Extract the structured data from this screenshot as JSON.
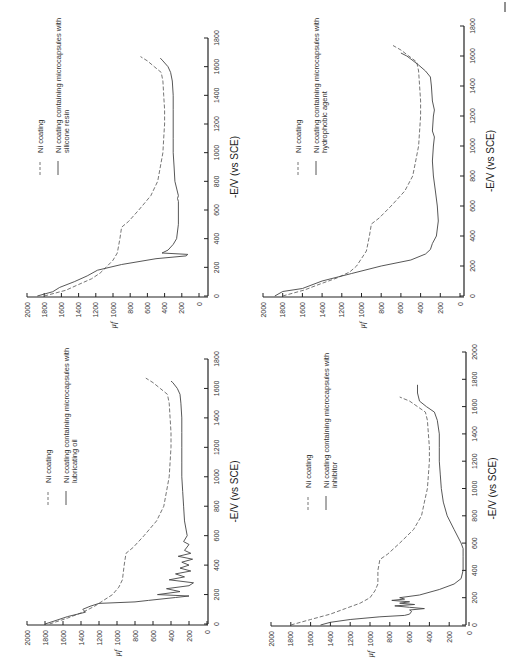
{
  "figure": {
    "orientation": "rotated 90 degrees counter-clockwise",
    "panel_count": 4,
    "corner_mark": "|"
  },
  "chart_data": [
    {
      "type": "line",
      "panel": "top-left",
      "xlabel": "-E/V (vs SCE)",
      "ylabel": "μf",
      "xlim": [
        0,
        1800
      ],
      "ylim": [
        0,
        2000
      ],
      "xticks": [
        "0",
        "200",
        "400",
        "600",
        "800",
        "1000",
        "1200",
        "1400",
        "1600",
        "1800"
      ],
      "yticks": [
        "2000",
        "1800",
        "1600",
        "1400",
        "1200",
        "1000",
        "800",
        "600",
        "400",
        "200",
        "0"
      ],
      "grid": false,
      "legend": [
        "Ni coating",
        "Ni coating containing microcapsules with silicone resin"
      ],
      "series": [
        {
          "name": "Ni coating",
          "style": "dashed",
          "x": [
            0,
            40,
            80,
            120,
            160,
            200,
            250,
            300,
            400,
            480,
            520,
            600,
            700,
            800,
            900,
            1000,
            1100,
            1200,
            1300,
            1400,
            1500,
            1560,
            1600,
            1640,
            1670
          ],
          "y": [
            1800,
            1550,
            1400,
            1250,
            1150,
            1080,
            1000,
            950,
            920,
            900,
            820,
            700,
            560,
            480,
            450,
            420,
            410,
            400,
            400,
            410,
            420,
            440,
            520,
            600,
            680
          ]
        },
        {
          "name": "Ni coating containing microcapsules with silicone resin",
          "style": "solid",
          "x": [
            0,
            30,
            60,
            100,
            140,
            180,
            220,
            260,
            280,
            290,
            300,
            320,
            360,
            400,
            500,
            600,
            660,
            680,
            700,
            800,
            900,
            1000,
            1100,
            1200,
            1300,
            1400,
            1500,
            1560,
            1600,
            1640,
            1660
          ],
          "y": [
            1880,
            1700,
            1620,
            1450,
            1300,
            1180,
            900,
            500,
            150,
            130,
            430,
            360,
            300,
            260,
            240,
            240,
            240,
            250,
            240,
            280,
            290,
            300,
            300,
            300,
            300,
            300,
            310,
            330,
            360,
            420,
            450
          ]
        }
      ]
    },
    {
      "type": "line",
      "panel": "top-right",
      "xlabel": "-E/V (vs SCE)",
      "ylabel": "μf",
      "xlim": [
        0,
        1800
      ],
      "ylim": [
        0,
        2000
      ],
      "xticks": [
        "0",
        "200",
        "400",
        "600",
        "800",
        "1000",
        "1200",
        "1400",
        "1600",
        "1800"
      ],
      "yticks": [
        "2000",
        "1800",
        "1600",
        "1400",
        "1200",
        "1000",
        "800",
        "600",
        "400",
        "200",
        "0"
      ],
      "grid": false,
      "legend": [
        "Ni coating",
        "Ni coating containing microcapsules with hydrophobic agent"
      ],
      "series": [
        {
          "name": "Ni coating",
          "style": "dashed",
          "x": [
            0,
            40,
            80,
            120,
            160,
            200,
            250,
            300,
            400,
            480,
            520,
            600,
            700,
            800,
            900,
            1000,
            1100,
            1200,
            1300,
            1400,
            1500,
            1560,
            1600,
            1640,
            1670
          ],
          "y": [
            1800,
            1580,
            1420,
            1250,
            1120,
            1050,
            1000,
            950,
            920,
            900,
            820,
            700,
            560,
            480,
            450,
            420,
            410,
            400,
            400,
            410,
            420,
            440,
            520,
            600,
            680
          ]
        },
        {
          "name": "Ni coating containing microcapsules with hydrophobic agent",
          "style": "solid",
          "x": [
            0,
            30,
            50,
            100,
            150,
            200,
            240,
            280,
            310,
            350,
            400,
            500,
            600,
            700,
            800,
            900,
            1000,
            1060,
            1100,
            1200,
            1240,
            1300,
            1400,
            1460,
            1500,
            1540,
            1580,
            1600,
            1620
          ],
          "y": [
            1880,
            1800,
            1600,
            1400,
            1100,
            800,
            500,
            350,
            300,
            280,
            240,
            220,
            230,
            250,
            270,
            280,
            270,
            260,
            280,
            270,
            260,
            280,
            290,
            300,
            350,
            420,
            500,
            540,
            600
          ]
        }
      ]
    },
    {
      "type": "line",
      "panel": "bottom-left",
      "xlabel": "-E/V (vs SCE)",
      "ylabel": "μf",
      "xlim": [
        0,
        1800
      ],
      "ylim": [
        0,
        2000
      ],
      "xticks": [
        "0",
        "200",
        "400",
        "600",
        "800",
        "1000",
        "1200",
        "1400",
        "1600",
        "1800"
      ],
      "yticks": [
        "2000",
        "1800",
        "1600",
        "1400",
        "1200",
        "1000",
        "800",
        "600",
        "400",
        "200",
        "0"
      ],
      "grid": false,
      "legend": [
        "Ni coating",
        "Ni coating containing microcapsules with lubricating oil"
      ],
      "series": [
        {
          "name": "Ni coating",
          "style": "dashed",
          "x": [
            0,
            40,
            80,
            120,
            160,
            200,
            250,
            300,
            400,
            480,
            520,
            600,
            700,
            800,
            900,
            1000,
            1100,
            1200,
            1300,
            1400,
            1500,
            1560,
            1600,
            1640,
            1670
          ],
          "y": [
            1750,
            1550,
            1380,
            1250,
            1150,
            1050,
            980,
            940,
            920,
            900,
            820,
            700,
            560,
            480,
            450,
            420,
            410,
            400,
            400,
            410,
            420,
            440,
            520,
            600,
            680
          ]
        },
        {
          "name": "Ni coating containing microcapsules with lubricating oil",
          "style": "solid",
          "x": [
            0,
            20,
            50,
            80,
            100,
            120,
            140,
            150,
            160,
            180,
            190,
            200,
            220,
            240,
            260,
            280,
            300,
            320,
            340,
            360,
            380,
            400,
            420,
            440,
            460,
            480,
            500,
            540,
            560,
            600,
            700,
            800,
            900,
            1000,
            1100,
            1200,
            1300,
            1400,
            1500,
            1560,
            1600,
            1640,
            1650
          ],
          "y": [
            1800,
            1700,
            1550,
            1350,
            1380,
            1300,
            1200,
            800,
            650,
            350,
            200,
            550,
            300,
            450,
            200,
            150,
            420,
            250,
            350,
            180,
            300,
            200,
            280,
            160,
            320,
            180,
            250,
            200,
            260,
            220,
            250,
            260,
            270,
            280,
            280,
            280,
            280,
            280,
            290,
            300,
            330,
            380,
            400
          ]
        }
      ]
    },
    {
      "type": "line",
      "panel": "bottom-right",
      "xlabel": "-E/V (vs SCE)",
      "ylabel": "μf",
      "xlim": [
        0,
        2000
      ],
      "ylim": [
        0,
        2000
      ],
      "xticks": [
        "0",
        "200",
        "400",
        "600",
        "800",
        "1000",
        "1200",
        "1400",
        "1600",
        "1800",
        "2000"
      ],
      "yticks": [
        "2000",
        "1800",
        "1600",
        "1400",
        "1200",
        "1000",
        "800",
        "600",
        "400",
        "200",
        "0"
      ],
      "grid": false,
      "legend": [
        "Ni coating",
        "Ni coating containing microcapsules with inhibitor"
      ],
      "series": [
        {
          "name": "Ni coating",
          "style": "dashed",
          "x": [
            0,
            40,
            80,
            120,
            160,
            200,
            250,
            300,
            400,
            480,
            520,
            600,
            700,
            800,
            900,
            1000,
            1100,
            1200,
            1300,
            1400,
            1500,
            1560,
            1600,
            1640,
            1670
          ],
          "y": [
            1800,
            1600,
            1400,
            1250,
            1100,
            1000,
            950,
            920,
            920,
            900,
            820,
            700,
            560,
            480,
            450,
            420,
            410,
            400,
            400,
            410,
            420,
            440,
            520,
            600,
            700
          ]
        },
        {
          "name": "Ni coating containing microcapsules with inhibitor",
          "style": "solid",
          "x": [
            0,
            20,
            40,
            60,
            70,
            80,
            100,
            110,
            120,
            130,
            140,
            150,
            160,
            170,
            180,
            190,
            200,
            220,
            260,
            300,
            340,
            400,
            500,
            560,
            600,
            700,
            800,
            900,
            1000,
            1100,
            1200,
            1300,
            1400,
            1500,
            1560,
            1600,
            1640,
            1700,
            1760
          ],
          "y": [
            1500,
            1400,
            1200,
            900,
            650,
            600,
            580,
            600,
            450,
            600,
            750,
            550,
            700,
            600,
            780,
            650,
            700,
            500,
            300,
            150,
            80,
            60,
            60,
            60,
            80,
            150,
            220,
            260,
            280,
            290,
            300,
            300,
            300,
            320,
            350,
            430,
            500,
            520,
            520
          ]
        }
      ]
    }
  ]
}
